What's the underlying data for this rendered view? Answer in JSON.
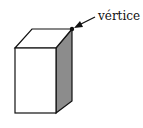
{
  "diagram": {
    "label": "vértice",
    "shape": "rectangular-prism",
    "colors": {
      "stroke": "#111111",
      "front_face": "#ffffff",
      "top_face": "#ffffff",
      "side_face": "#8c8c8c"
    }
  }
}
